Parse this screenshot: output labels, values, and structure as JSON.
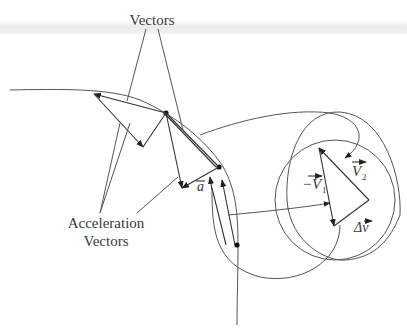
{
  "labels": {
    "top_label": "Vectors",
    "bottom_label_line1": "Acceleration",
    "bottom_label_line2": "Vectors",
    "accel": "a",
    "neg_v1": "−V",
    "neg_v1_sub": "1",
    "v2": "V",
    "v2_sub": "2",
    "delta_v": "Δv"
  },
  "colors": {
    "stroke": "#444444",
    "text": "#3a3a3a",
    "background": "#ffffff"
  }
}
